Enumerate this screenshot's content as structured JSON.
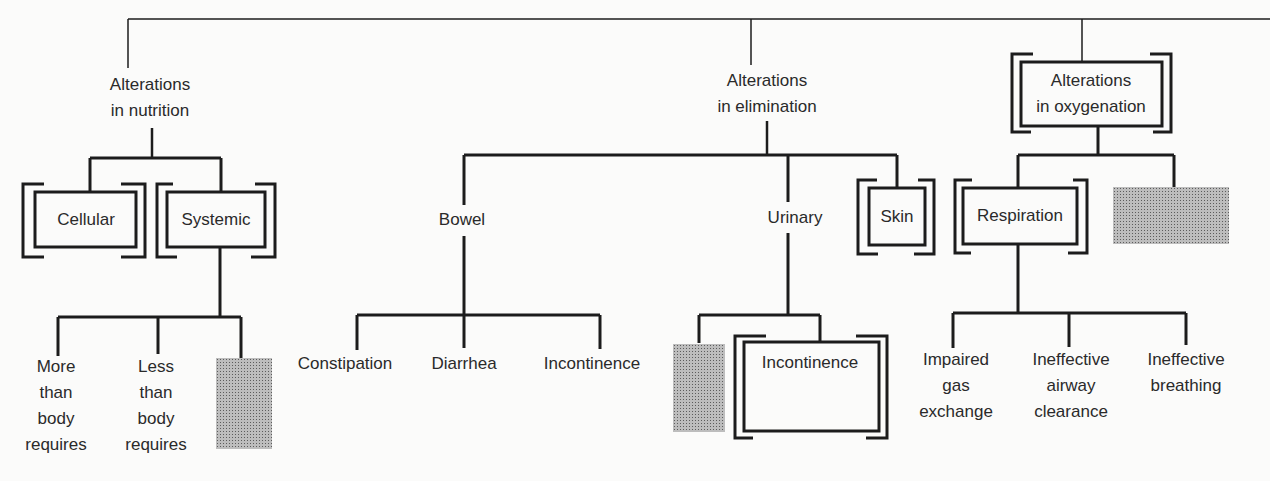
{
  "diagram": {
    "nutrition": {
      "label_line1": "Alterations",
      "label_line2": "in nutrition",
      "children": {
        "cellular": "Cellular",
        "systemic": "Systemic"
      },
      "systemic_children": [
        {
          "lines": [
            "More",
            "than",
            "body",
            "requires"
          ]
        },
        {
          "lines": [
            "Less",
            "than",
            "body",
            "requires"
          ]
        },
        {
          "hatched": true
        }
      ]
    },
    "elimination": {
      "label_line1": "Alterations",
      "label_line2": "in elimination",
      "children": {
        "bowel": "Bowel",
        "urinary": "Urinary",
        "skin": "Skin"
      },
      "bowel_children": [
        "Constipation",
        "Diarrhea",
        "Incontinence"
      ],
      "urinary_children": [
        {
          "hatched": true
        },
        {
          "label": "Incontinence",
          "boxed": true
        }
      ]
    },
    "oxygenation": {
      "label_line1": "Alterations",
      "label_line2": "in oxygenation",
      "children": {
        "respiration": "Respiration",
        "other": {
          "hatched": true
        }
      },
      "respiration_children": [
        {
          "lines": [
            "Impaired",
            "gas",
            "exchange"
          ]
        },
        {
          "lines": [
            "Ineffective",
            "airway",
            "clearance"
          ]
        },
        {
          "lines": [
            "Ineffective",
            "breathing"
          ]
        }
      ]
    }
  },
  "colors": {
    "line": "#1c1c1c",
    "text": "#2a2a2a",
    "background": "#fbfbfa",
    "hatch": "#9a9a9a"
  }
}
